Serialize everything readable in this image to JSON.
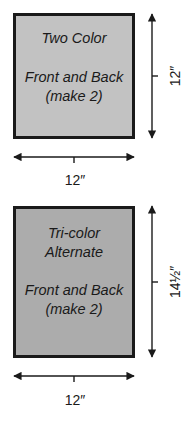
{
  "panels": [
    {
      "title_lines": [
        "Two Color"
      ],
      "body_lines": [
        "Front and Back",
        "(make 2)"
      ],
      "width_label": "12″",
      "height_label": "12″",
      "fill": "#c2c2c2"
    },
    {
      "title_lines": [
        "Tri-color",
        "Alternate"
      ],
      "body_lines": [
        "Front and Back",
        "(make 2)"
      ],
      "width_label": "12″",
      "height_label": "14½″",
      "fill": "#acacac"
    }
  ],
  "colors": {
    "stroke": "#1a1a1a",
    "background": "#ffffff"
  }
}
